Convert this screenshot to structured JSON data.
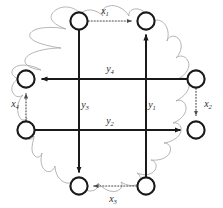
{
  "figure": {
    "width": 223,
    "height": 208,
    "background_color": "#ffffff"
  },
  "colors": {
    "node_stroke": "#1a1a1a",
    "node_fill": "#ffffff",
    "solid_edge": "#1a1a1a",
    "dotted_edge": "#4a4a4a",
    "squiggle": "#a8a8a8",
    "label_text": "#2b2b2b"
  },
  "nodes": [
    {
      "id": "top-left",
      "cx": 79,
      "cy": 21,
      "r": 8.6
    },
    {
      "id": "top-right",
      "cx": 146,
      "cy": 21,
      "r": 8.6
    },
    {
      "id": "left-upper",
      "cx": 26,
      "cy": 79,
      "r": 8.6
    },
    {
      "id": "right-upper",
      "cx": 196,
      "cy": 79,
      "r": 8.6
    },
    {
      "id": "left-lower",
      "cx": 26,
      "cy": 130,
      "r": 8.6
    },
    {
      "id": "right-lower",
      "cx": 196,
      "cy": 130,
      "r": 8.6
    },
    {
      "id": "bottom-left",
      "cx": 79,
      "cy": 186,
      "r": 8.6
    },
    {
      "id": "bottom-right",
      "cx": 146,
      "cy": 186,
      "r": 8.6
    }
  ],
  "solid_edges": [
    {
      "id": "edge-y3",
      "from": "top-left",
      "to": "bottom-left",
      "direction": "down",
      "label": "y",
      "sub": "3"
    },
    {
      "id": "edge-y1",
      "from": "bottom-right",
      "to": "top-right",
      "direction": "up",
      "label": "y",
      "sub": "1"
    },
    {
      "id": "edge-y4",
      "from": "right-upper",
      "to": "left-upper",
      "direction": "left",
      "label": "y",
      "sub": "4"
    },
    {
      "id": "edge-y2",
      "from": "left-lower",
      "to": "right-lower",
      "direction": "right",
      "label": "y",
      "sub": "2"
    }
  ],
  "dotted_edges": [
    {
      "id": "edge-x1",
      "from": "top-left",
      "to": "top-right",
      "direction": "right",
      "label": "x",
      "sub": "1"
    },
    {
      "id": "edge-x2",
      "from": "right-upper",
      "to": "right-lower",
      "direction": "down",
      "label": "x",
      "sub": "2"
    },
    {
      "id": "edge-x3",
      "from": "bottom-right",
      "to": "bottom-left",
      "direction": "left",
      "label": "x",
      "sub": "3"
    },
    {
      "id": "edge-x4",
      "from": "left-lower",
      "to": "left-upper",
      "direction": "up",
      "label": "x",
      "sub": "4"
    }
  ],
  "labels": {
    "x1": {
      "base": "x",
      "sub": "1",
      "x": 110,
      "y": 13
    },
    "x2": {
      "base": "x",
      "sub": "2",
      "x": 207,
      "y": 106
    },
    "x3": {
      "base": "x",
      "sub": "3",
      "x": 112,
      "y": 201
    },
    "x4": {
      "base": "x",
      "sub": "4",
      "x": 15,
      "y": 106
    },
    "y1": {
      "base": "y",
      "sub": "1",
      "x": 150,
      "y": 107
    },
    "y2": {
      "base": "y",
      "sub": "2",
      "x": 110,
      "y": 122
    },
    "y3": {
      "base": "y",
      "sub": "3",
      "x": 83,
      "y": 107
    },
    "y4": {
      "base": "y",
      "sub": "4",
      "x": 110,
      "y": 70
    }
  }
}
